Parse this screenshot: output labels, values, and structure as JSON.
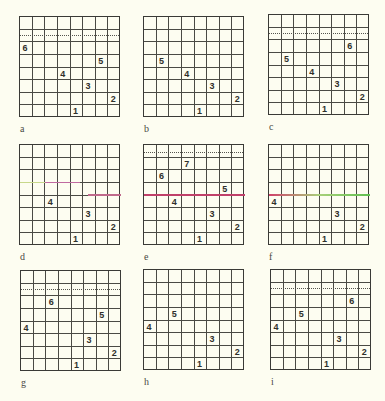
{
  "figure": {
    "grid_size": 8,
    "background_color": "#fdfdf1",
    "line_color": "#3a3a36",
    "panels": [
      {
        "id": "a",
        "label": "a",
        "left": 19,
        "top": 16,
        "dotted_row": 1,
        "dotted_offset": 6,
        "numbers": [
          {
            "value": "6",
            "row": 2,
            "col": 0
          },
          {
            "value": "5",
            "row": 3,
            "col": 6
          },
          {
            "value": "4",
            "row": 4,
            "col": 3
          },
          {
            "value": "3",
            "row": 5,
            "col": 5
          },
          {
            "value": "2",
            "row": 6,
            "col": 7
          },
          {
            "value": "1",
            "row": 7,
            "col": 4
          }
        ],
        "segments": []
      },
      {
        "id": "b",
        "label": "b",
        "left": 143,
        "top": 16,
        "dotted_row": null,
        "numbers": [
          {
            "value": "5",
            "row": 3,
            "col": 1
          },
          {
            "value": "4",
            "row": 4,
            "col": 3
          },
          {
            "value": "3",
            "row": 5,
            "col": 5
          },
          {
            "value": "2",
            "row": 6,
            "col": 7
          },
          {
            "value": "1",
            "row": 7,
            "col": 4
          }
        ],
        "segments": []
      },
      {
        "id": "c",
        "label": "c",
        "left": 268,
        "top": 14,
        "dotted_row": 1,
        "dotted_offset": 6,
        "numbers": [
          {
            "value": "6",
            "row": 2,
            "col": 6
          },
          {
            "value": "5",
            "row": 3,
            "col": 1
          },
          {
            "value": "4",
            "row": 4,
            "col": 3
          },
          {
            "value": "3",
            "row": 5,
            "col": 5
          },
          {
            "value": "2",
            "row": 6,
            "col": 7
          },
          {
            "value": "1",
            "row": 7,
            "col": 4
          }
        ],
        "segments": []
      },
      {
        "id": "d",
        "label": "d",
        "left": 19,
        "top": 144,
        "dotted_row": null,
        "numbers": [
          {
            "value": "4",
            "row": 4,
            "col": 2
          },
          {
            "value": "3",
            "row": 5,
            "col": 5
          },
          {
            "value": "2",
            "row": 6,
            "col": 7
          },
          {
            "value": "1",
            "row": 7,
            "col": 4
          }
        ],
        "segments": [
          {
            "line": 3,
            "from": 0,
            "to": 25,
            "color": "#c8d88a"
          },
          {
            "line": 3,
            "from": 25,
            "to": 60,
            "color": "#c06aa0"
          },
          {
            "line": 4,
            "from": 68,
            "to": 101,
            "color": "#c06a8c"
          }
        ]
      },
      {
        "id": "e",
        "label": "e",
        "left": 143,
        "top": 144,
        "dotted_row": 0,
        "dotted_offset": 8,
        "numbers": [
          {
            "value": "7",
            "row": 1,
            "col": 3
          },
          {
            "value": "6",
            "row": 2,
            "col": 1
          },
          {
            "value": "5",
            "row": 3,
            "col": 6
          },
          {
            "value": "4",
            "row": 4,
            "col": 2
          },
          {
            "value": "3",
            "row": 5,
            "col": 5
          },
          {
            "value": "2",
            "row": 6,
            "col": 7
          },
          {
            "value": "1",
            "row": 7,
            "col": 4
          }
        ],
        "segments": [
          {
            "line": 4,
            "from": 0,
            "to": 101,
            "color": "#c0406a"
          }
        ]
      },
      {
        "id": "f",
        "label": "f",
        "left": 268,
        "top": 144,
        "dotted_row": null,
        "numbers": [
          {
            "value": "4",
            "row": 4,
            "col": 0
          },
          {
            "value": "3",
            "row": 5,
            "col": 5
          },
          {
            "value": "2",
            "row": 6,
            "col": 7
          },
          {
            "value": "1",
            "row": 7,
            "col": 4
          }
        ],
        "segments": [
          {
            "line": 4,
            "from": 0,
            "to": 101,
            "gradient": [
              "#d0406a",
              "#a8d07a",
              "#60c050"
            ]
          }
        ]
      },
      {
        "id": "g",
        "label": "g",
        "left": 20,
        "top": 270,
        "dotted_row": 1,
        "dotted_offset": 6,
        "numbers": [
          {
            "value": "6",
            "row": 2,
            "col": 2
          },
          {
            "value": "5",
            "row": 3,
            "col": 6
          },
          {
            "value": "4",
            "row": 4,
            "col": 0
          },
          {
            "value": "3",
            "row": 5,
            "col": 5
          },
          {
            "value": "2",
            "row": 6,
            "col": 7
          },
          {
            "value": "1",
            "row": 7,
            "col": 4
          }
        ],
        "segments": []
      },
      {
        "id": "h",
        "label": "h",
        "left": 143,
        "top": 269,
        "dotted_row": null,
        "numbers": [
          {
            "value": "5",
            "row": 3,
            "col": 2
          },
          {
            "value": "4",
            "row": 4,
            "col": 0
          },
          {
            "value": "3",
            "row": 5,
            "col": 5
          },
          {
            "value": "2",
            "row": 6,
            "col": 7
          },
          {
            "value": "1",
            "row": 7,
            "col": 4
          }
        ],
        "segments": []
      },
      {
        "id": "i",
        "label": "i",
        "left": 270,
        "top": 269,
        "dotted_row": 1,
        "dotted_offset": 6,
        "numbers": [
          {
            "value": "6",
            "row": 2,
            "col": 6
          },
          {
            "value": "5",
            "row": 3,
            "col": 2
          },
          {
            "value": "4",
            "row": 4,
            "col": 0
          },
          {
            "value": "3",
            "row": 5,
            "col": 5
          },
          {
            "value": "2",
            "row": 6,
            "col": 7
          },
          {
            "value": "1",
            "row": 7,
            "col": 4
          }
        ],
        "segments": []
      }
    ]
  }
}
